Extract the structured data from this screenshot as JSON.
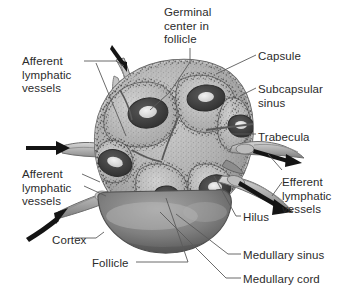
{
  "figure": {
    "background_color": "#ffffff",
    "text_color": "#2b2b2b",
    "style": "grayscale halftone anatomical illustration"
  },
  "labels": [
    {
      "id": "germinal-center",
      "text": "Germinal\ncenter in\nfollicle",
      "x": 164,
      "y": 6,
      "side": "top"
    },
    {
      "id": "afferent-top",
      "text": "Afferent\nlymphatic\nvessels",
      "x": 22,
      "y": 55,
      "side": "left"
    },
    {
      "id": "capsule",
      "text": "Capsule",
      "x": 258,
      "y": 50,
      "side": "right"
    },
    {
      "id": "subcapsular-sinus",
      "text": "Subcapsular\nsinus",
      "x": 258,
      "y": 83,
      "side": "right"
    },
    {
      "id": "trabecula",
      "text": "Trabecula",
      "x": 258,
      "y": 131,
      "side": "right"
    },
    {
      "id": "afferent-bottom",
      "text": "Afferent\nlymphatic\nvessels",
      "x": 22,
      "y": 168,
      "side": "left"
    },
    {
      "id": "efferent",
      "text": "Efferent\nlymphatic\nvessels",
      "x": 282,
      "y": 176,
      "side": "right"
    },
    {
      "id": "hilus",
      "text": "Hilus",
      "x": 243,
      "y": 211,
      "side": "right"
    },
    {
      "id": "cortex",
      "text": "Cortex",
      "x": 52,
      "y": 234,
      "side": "left"
    },
    {
      "id": "follicle",
      "text": "Follicle",
      "x": 92,
      "y": 257,
      "side": "left"
    },
    {
      "id": "medullary-sinus",
      "text": "Medullary sinus",
      "x": 243,
      "y": 249,
      "side": "right"
    },
    {
      "id": "medullary-cord",
      "text": "Medullary cord",
      "x": 243,
      "y": 273,
      "side": "right"
    }
  ],
  "structures": {
    "node_body": "lymph node cortex and medulla mass",
    "capsule_rim": "outer capsule",
    "follicles": "dark follicles with light germinal centers",
    "afferent_vessel_count": 3,
    "efferent_vessel_count": 2,
    "arrow_direction_afferent": "inward",
    "arrow_direction_efferent": "outward"
  },
  "colors": {
    "ink": "#2b2b2b",
    "leader": "#555555",
    "tissue_light": "#c9c9c9",
    "tissue_mid": "#9a9a9a",
    "tissue_dark": "#5d5d5d",
    "follicle_dark": "#3a3a3a",
    "germinal_light": "#e8e8e8",
    "vessel_fill": "#b5b5b5",
    "vessel_edge": "#6e6e6e",
    "medulla_shade": "#7a7a7a"
  }
}
